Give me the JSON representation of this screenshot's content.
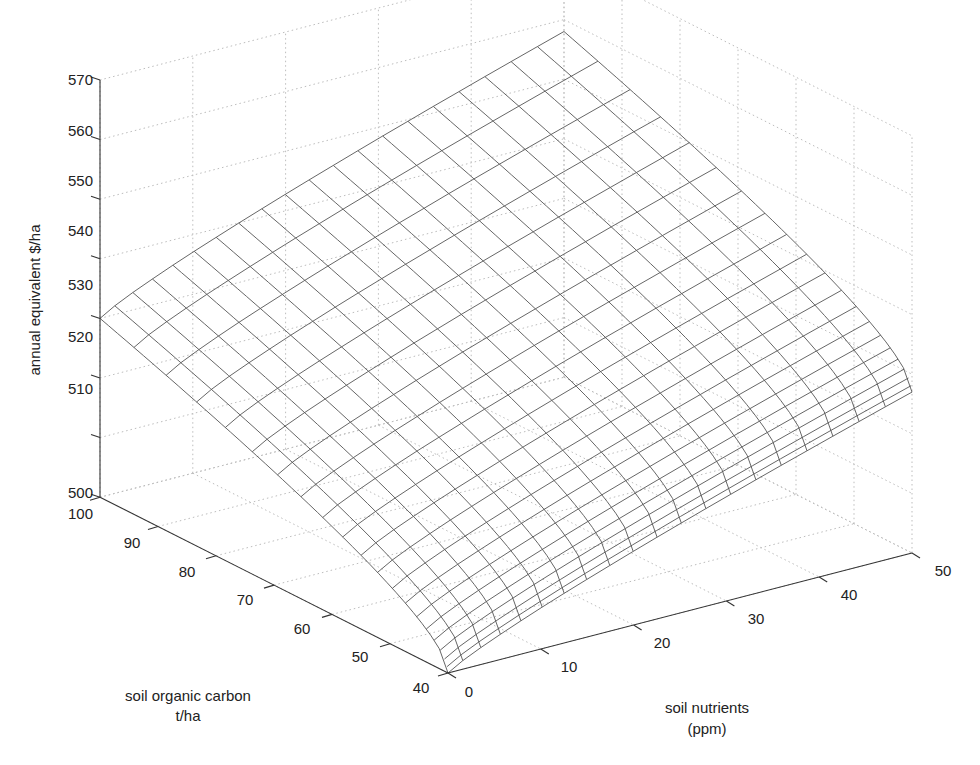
{
  "chart_data": {
    "type": "surface3d",
    "title": "",
    "xlabel": "soil nutrients\n(ppm)",
    "ylabel": "soil organic carbon\nt/ha",
    "zlabel": "annual equivalent $/ha",
    "x_axis": {
      "label_lines": [
        "soil nutrients",
        "(ppm)"
      ],
      "range": [
        0,
        50
      ],
      "ticks": [
        0,
        10,
        20,
        30,
        40,
        50
      ]
    },
    "y_axis": {
      "label_lines": [
        "soil organic carbon",
        "t/ha"
      ],
      "range": [
        40,
        100
      ],
      "ticks": [
        40,
        50,
        60,
        70,
        80,
        90,
        100
      ]
    },
    "z_axis": {
      "label": "annual equivalent $/ha",
      "range": [
        500,
        570
      ],
      "ticks": [
        500,
        510,
        520,
        530,
        540,
        550,
        560,
        570
      ]
    },
    "grid": true,
    "mesh": {
      "nutrient_steps": 20,
      "soc_steps": 20,
      "color": "#555555"
    },
    "corner_values": [
      {
        "soil_nutrients": 0,
        "soil_organic_carbon": 40,
        "value": 500
      },
      {
        "soil_nutrients": 0,
        "soil_organic_carbon": 100,
        "value": 530
      },
      {
        "soil_nutrients": 50,
        "soil_organic_carbon": 40,
        "value": 527
      },
      {
        "soil_nutrients": 50,
        "soil_organic_carbon": 100,
        "value": 558
      }
    ],
    "surface_shape": "saddle-like wireframe rising with both soil nutrients and soil organic carbon, concave with diminishing returns"
  },
  "labels": {
    "z_title": "annual equivalent $/ha",
    "soc_title_1": "soil organic carbon",
    "soc_title_2": "t/ha",
    "nut_title_1": "soil nutrients",
    "nut_title_2": "(ppm)",
    "z_ticks": [
      "500",
      "510",
      "520",
      "530",
      "540",
      "550",
      "560",
      "570"
    ],
    "soc_ticks": [
      "40",
      "50",
      "60",
      "70",
      "80",
      "90",
      "100"
    ],
    "nut_ticks": [
      "0",
      "10",
      "20",
      "30",
      "40",
      "50"
    ]
  }
}
